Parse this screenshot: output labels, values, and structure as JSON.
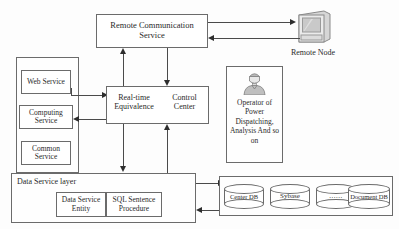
{
  "diagram": {
    "nodes": {
      "remote_comm_service": "Remote Communication Service",
      "remote_node_label": "Remote Node",
      "web_service": "Web Service",
      "computing_service": "Computing Service",
      "common_service": "Common Service",
      "realtime_equivalence": "Real-time Equivalence",
      "control_center": "Control Center",
      "operator": "Operator of Power Dispatching, Analysis And so on",
      "data_service_layer": "Data Service layer",
      "data_service_entity": "Data Service Entity",
      "sql_sentence_procedure": "SQL Sentence Procedure"
    },
    "databases": [
      {
        "name": "Center DB"
      },
      {
        "name": "Sybase"
      },
      {
        "name": "......"
      },
      {
        "name": "Document DB"
      }
    ],
    "icons": {
      "monitor": "monitor-icon",
      "operator": "person-icon"
    },
    "colors": {
      "stroke": "#6b6b6b",
      "arrow": "#2e2e2e",
      "text": "#2a2a2a",
      "background": "#fdfdfd",
      "monitor_screen": "#c9c9c9",
      "icon_fill": "#bdbdbd"
    }
  }
}
